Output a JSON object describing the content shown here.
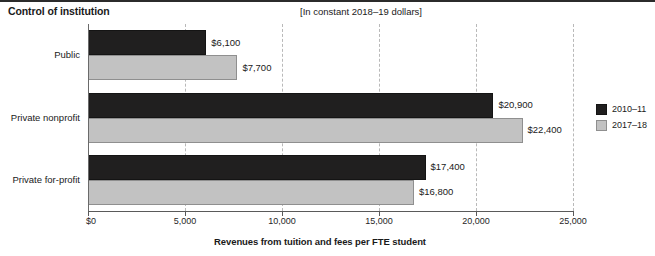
{
  "header": {
    "title": "Control of institution",
    "subtitle": "[In constant 2018–19 dollars]"
  },
  "legend": {
    "position": "right",
    "items": [
      {
        "label": "2010–11",
        "color": "#201f1f"
      },
      {
        "label": "2017–18",
        "color": "#c2c2c2"
      }
    ]
  },
  "axis": {
    "x_title": "Revenues from tuition and fees per FTE student",
    "ticks": [
      "$0",
      "5,000",
      "10,000",
      "15,000",
      "20,000",
      "25,000"
    ],
    "tick_values": [
      0,
      5000,
      10000,
      15000,
      20000,
      25000
    ]
  },
  "categories": [
    "Public",
    "Private nonprofit",
    "Private for-profit"
  ],
  "bar_labels": {
    "public": [
      "$6,100",
      "$7,700"
    ],
    "private_nonprofit": [
      "$20,900",
      "$22,400"
    ],
    "private_for_profit": [
      "$17,400",
      "$16,800"
    ]
  },
  "chart_data": {
    "type": "bar",
    "orientation": "horizontal",
    "title": "Control of institution",
    "subtitle": "[In constant 2018–19 dollars]",
    "xlabel": "Revenues from tuition and fees per FTE student",
    "ylabel": "Control of institution",
    "categories": [
      "Public",
      "Private nonprofit",
      "Private for-profit"
    ],
    "series": [
      {
        "name": "2010–11",
        "color": "#201f1f",
        "values": [
          6100,
          20900,
          17400
        ]
      },
      {
        "name": "2017–18",
        "color": "#c2c2c2",
        "values": [
          7700,
          22400,
          16800
        ]
      }
    ],
    "data_labels": [
      [
        "$6,100",
        "$20,900",
        "$17,400"
      ],
      [
        "$7,700",
        "$22,400",
        "$16,800"
      ]
    ],
    "xlim": [
      0,
      25000
    ],
    "xticks": [
      0,
      5000,
      10000,
      15000,
      20000,
      25000
    ],
    "xticklabels": [
      "$0",
      "5,000",
      "10,000",
      "15,000",
      "20,000",
      "25,000"
    ],
    "grid": "vertical-dashed",
    "legend_position": "right"
  }
}
